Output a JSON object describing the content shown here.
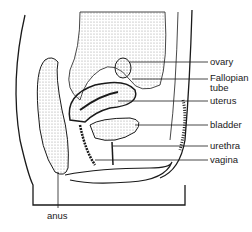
{
  "diagram": {
    "type": "anatomical cross-section",
    "labels": [
      {
        "id": "ovary",
        "text": "ovary",
        "x": 210,
        "y": 57
      },
      {
        "id": "fallopian",
        "text": "Fallopian",
        "x": 210,
        "y": 73
      },
      {
        "id": "tube",
        "text": "tube",
        "x": 210,
        "y": 83
      },
      {
        "id": "uterus",
        "text": "uterus",
        "x": 210,
        "y": 96
      },
      {
        "id": "bladder",
        "text": "bladder",
        "x": 210,
        "y": 120
      },
      {
        "id": "urethra",
        "text": "urethra",
        "x": 210,
        "y": 141
      },
      {
        "id": "vagina",
        "text": "vagina",
        "x": 210,
        "y": 155
      },
      {
        "id": "anus",
        "text": "anus",
        "x": 47,
        "y": 211
      }
    ],
    "colors": {
      "ink": "#1a1a1a",
      "stipple": "#bdbdbd",
      "background": "#ffffff"
    }
  }
}
